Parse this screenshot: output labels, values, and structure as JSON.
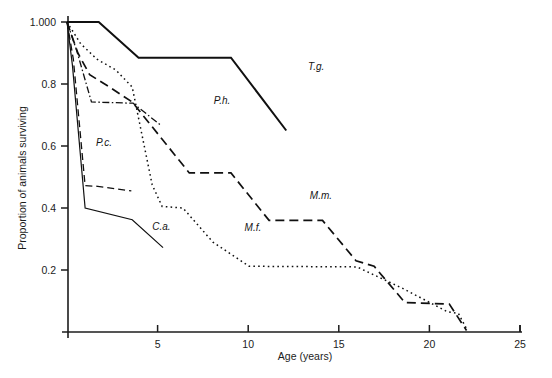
{
  "figure": {
    "background_color": "#ffffff",
    "ink_color": "#101010"
  },
  "chart_data": {
    "type": "line",
    "title": "",
    "subtitle": "",
    "xlabel": "Age (years)",
    "ylabel": "Proportion of animals surviving",
    "xlim": [
      0,
      25
    ],
    "ylim": [
      0,
      1.0
    ],
    "xticks": [
      0,
      5,
      10,
      15,
      20,
      25
    ],
    "xticklabels": [
      "",
      "5",
      "10",
      "15",
      "20",
      "25"
    ],
    "yticks": [
      0.2,
      0.4,
      0.6,
      0.8,
      1.0
    ],
    "yticklabels": [
      "0.2",
      "0.4",
      "0.6",
      "0.8",
      "1.000"
    ],
    "grid": false,
    "legend": "inline-annotations",
    "annotations": [
      {
        "text": "T.g.",
        "x": 13.3,
        "y": 0.845
      },
      {
        "text": "P.h.",
        "x": 8.1,
        "y": 0.735
      },
      {
        "text": "P.c.",
        "x": 1.6,
        "y": 0.6
      },
      {
        "text": "C.a.",
        "x": 4.7,
        "y": 0.33
      },
      {
        "text": "M.f.",
        "x": 9.8,
        "y": 0.325
      },
      {
        "text": "M.m.",
        "x": 13.4,
        "y": 0.43
      }
    ],
    "series": [
      {
        "name": "T.g.",
        "label": "T.g.",
        "style": "solid",
        "stroke_width": 2.0,
        "dash": "none",
        "points": [
          [
            0.0,
            1.0
          ],
          [
            1.75,
            1.0
          ],
          [
            3.95,
            0.885
          ],
          [
            9.05,
            0.885
          ],
          [
            12.1,
            0.65
          ]
        ]
      },
      {
        "name": "P.h.",
        "label": "P.h.",
        "style": "dash-dot",
        "stroke_width": 1.3,
        "dash": "7,2.5,1.5,2.5",
        "points": [
          [
            0.0,
            1.0
          ],
          [
            0.55,
            0.905
          ],
          [
            1.35,
            0.742
          ],
          [
            3.65,
            0.738
          ],
          [
            5.15,
            0.668
          ]
        ]
      },
      {
        "name": "P.c.",
        "label": "P.c.",
        "style": "dashed",
        "stroke_width": 1.3,
        "dash": "7,4",
        "points": [
          [
            0.0,
            1.0
          ],
          [
            0.35,
            0.88
          ],
          [
            1.0,
            0.472
          ],
          [
            1.7,
            0.47
          ],
          [
            3.55,
            0.455
          ]
        ]
      },
      {
        "name": "C.a.",
        "label": "C.a.",
        "style": "solid",
        "stroke_width": 1.2,
        "dash": "none",
        "points": [
          [
            0.0,
            1.0
          ],
          [
            0.3,
            0.86
          ],
          [
            1.0,
            0.4
          ],
          [
            3.6,
            0.362
          ],
          [
            5.3,
            0.272
          ]
        ]
      },
      {
        "name": "M.m.",
        "label": "M.m.",
        "style": "long-dash",
        "stroke_width": 1.7,
        "dash": "9,5",
        "points": [
          [
            0.0,
            1.0
          ],
          [
            0.6,
            0.9
          ],
          [
            1.25,
            0.83
          ],
          [
            2.35,
            0.79
          ],
          [
            3.6,
            0.742
          ],
          [
            6.75,
            0.513
          ],
          [
            9.05,
            0.513
          ],
          [
            11.15,
            0.36
          ],
          [
            14.1,
            0.36
          ],
          [
            15.95,
            0.23
          ],
          [
            16.95,
            0.212
          ],
          [
            18.65,
            0.095
          ],
          [
            21.1,
            0.09
          ],
          [
            22.05,
            0.005
          ]
        ]
      },
      {
        "name": "M.f.",
        "label": "M.f.",
        "style": "dotted",
        "stroke_width": 1.5,
        "dash": "1.6,3.2",
        "points": [
          [
            0.0,
            1.0
          ],
          [
            0.75,
            0.93
          ],
          [
            1.65,
            0.88
          ],
          [
            2.7,
            0.845
          ],
          [
            3.6,
            0.79
          ],
          [
            4.7,
            0.475
          ],
          [
            5.25,
            0.405
          ],
          [
            6.4,
            0.4
          ],
          [
            8.05,
            0.29
          ],
          [
            10.05,
            0.212
          ],
          [
            16.0,
            0.21
          ],
          [
            18.55,
            0.14
          ],
          [
            21.0,
            0.065
          ],
          [
            21.6,
            0.06
          ],
          [
            22.1,
            0.005
          ]
        ]
      }
    ]
  }
}
